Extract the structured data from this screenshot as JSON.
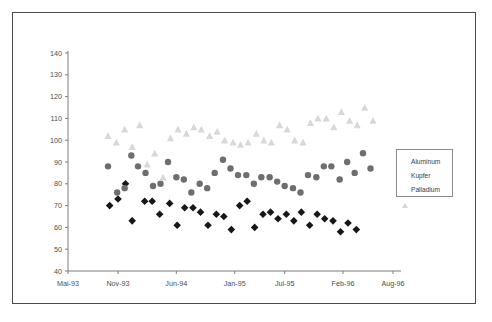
{
  "chart_data": {
    "type": "scatter",
    "title": "",
    "xlabel": "",
    "ylabel": "",
    "ylim": [
      40,
      140
    ],
    "ytick_step": 10,
    "yticks": [
      40,
      50,
      60,
      70,
      80,
      90,
      100,
      110,
      120,
      130,
      140
    ],
    "xticks": [
      "Mai-93",
      "Nov-93",
      "Jun-94",
      "Jan-95",
      "Jul-95",
      "Feb-96",
      "Aug-96"
    ],
    "xtick_positions_months": [
      0,
      6,
      13,
      20,
      26,
      33,
      39
    ],
    "grid": false,
    "legend_position": "right",
    "colors": {
      "aluminum": "#171717",
      "kupfer": "#6e6e6e",
      "palladium": "#d8d8d8",
      "axis": "#7d7d7d",
      "border": "#4a4a4a",
      "text": "#4d4d4d"
    },
    "series": [
      {
        "name": "Aluminum",
        "marker": "diamond",
        "color": "#171717",
        "points": [
          {
            "x": 5.0,
            "y": 70
          },
          {
            "x": 6.0,
            "y": 73
          },
          {
            "x": 6.9,
            "y": 80
          },
          {
            "x": 7.7,
            "y": 63
          },
          {
            "x": 9.2,
            "y": 72
          },
          {
            "x": 10.1,
            "y": 72
          },
          {
            "x": 11.0,
            "y": 66
          },
          {
            "x": 12.2,
            "y": 71
          },
          {
            "x": 13.1,
            "y": 61
          },
          {
            "x": 14.0,
            "y": 69
          },
          {
            "x": 15.0,
            "y": 69
          },
          {
            "x": 15.9,
            "y": 67
          },
          {
            "x": 16.8,
            "y": 61
          },
          {
            "x": 17.8,
            "y": 66
          },
          {
            "x": 18.7,
            "y": 65
          },
          {
            "x": 19.6,
            "y": 59
          },
          {
            "x": 20.6,
            "y": 70
          },
          {
            "x": 21.5,
            "y": 72
          },
          {
            "x": 22.4,
            "y": 60
          },
          {
            "x": 23.4,
            "y": 66
          },
          {
            "x": 24.3,
            "y": 67
          },
          {
            "x": 25.2,
            "y": 64
          },
          {
            "x": 26.2,
            "y": 66
          },
          {
            "x": 27.1,
            "y": 63
          },
          {
            "x": 28.0,
            "y": 67
          },
          {
            "x": 29.0,
            "y": 61
          },
          {
            "x": 29.9,
            "y": 66
          },
          {
            "x": 30.8,
            "y": 64
          },
          {
            "x": 31.8,
            "y": 63
          },
          {
            "x": 32.7,
            "y": 58
          },
          {
            "x": 33.6,
            "y": 62
          },
          {
            "x": 34.6,
            "y": 59
          }
        ]
      },
      {
        "name": "Kupfer",
        "marker": "circle",
        "color": "#6e6e6e",
        "points": [
          {
            "x": 4.8,
            "y": 88
          },
          {
            "x": 5.9,
            "y": 76
          },
          {
            "x": 6.8,
            "y": 78
          },
          {
            "x": 7.6,
            "y": 93
          },
          {
            "x": 8.4,
            "y": 88
          },
          {
            "x": 9.3,
            "y": 85
          },
          {
            "x": 10.2,
            "y": 79
          },
          {
            "x": 11.1,
            "y": 80
          },
          {
            "x": 12.0,
            "y": 90
          },
          {
            "x": 13.0,
            "y": 83
          },
          {
            "x": 13.9,
            "y": 82
          },
          {
            "x": 14.8,
            "y": 76
          },
          {
            "x": 15.8,
            "y": 80
          },
          {
            "x": 16.7,
            "y": 78
          },
          {
            "x": 17.6,
            "y": 85
          },
          {
            "x": 18.6,
            "y": 91
          },
          {
            "x": 19.5,
            "y": 87
          },
          {
            "x": 20.4,
            "y": 84
          },
          {
            "x": 21.4,
            "y": 84
          },
          {
            "x": 22.3,
            "y": 80
          },
          {
            "x": 23.2,
            "y": 83
          },
          {
            "x": 24.2,
            "y": 83
          },
          {
            "x": 25.1,
            "y": 81
          },
          {
            "x": 26.0,
            "y": 79
          },
          {
            "x": 27.0,
            "y": 78
          },
          {
            "x": 27.9,
            "y": 76
          },
          {
            "x": 28.8,
            "y": 84
          },
          {
            "x": 29.8,
            "y": 83
          },
          {
            "x": 30.7,
            "y": 88
          },
          {
            "x": 31.6,
            "y": 88
          },
          {
            "x": 32.6,
            "y": 82
          },
          {
            "x": 33.5,
            "y": 90
          },
          {
            "x": 34.4,
            "y": 85
          },
          {
            "x": 35.4,
            "y": 94
          },
          {
            "x": 36.3,
            "y": 87
          }
        ]
      },
      {
        "name": "Palladium",
        "marker": "triangle",
        "color": "#d8d8d8",
        "points": [
          {
            "x": 4.8,
            "y": 102
          },
          {
            "x": 5.8,
            "y": 99
          },
          {
            "x": 6.8,
            "y": 105
          },
          {
            "x": 7.7,
            "y": 97
          },
          {
            "x": 8.6,
            "y": 107
          },
          {
            "x": 9.5,
            "y": 89
          },
          {
            "x": 10.4,
            "y": 94
          },
          {
            "x": 11.4,
            "y": 83
          },
          {
            "x": 12.3,
            "y": 101
          },
          {
            "x": 13.2,
            "y": 105
          },
          {
            "x": 14.2,
            "y": 103
          },
          {
            "x": 15.1,
            "y": 106
          },
          {
            "x": 16.0,
            "y": 105
          },
          {
            "x": 17.0,
            "y": 102
          },
          {
            "x": 17.9,
            "y": 104
          },
          {
            "x": 18.8,
            "y": 100
          },
          {
            "x": 19.8,
            "y": 99
          },
          {
            "x": 20.7,
            "y": 98
          },
          {
            "x": 21.6,
            "y": 99
          },
          {
            "x": 22.6,
            "y": 103
          },
          {
            "x": 23.5,
            "y": 100
          },
          {
            "x": 24.4,
            "y": 99
          },
          {
            "x": 25.4,
            "y": 107
          },
          {
            "x": 26.3,
            "y": 105
          },
          {
            "x": 27.2,
            "y": 100
          },
          {
            "x": 28.2,
            "y": 99
          },
          {
            "x": 29.1,
            "y": 108
          },
          {
            "x": 30.0,
            "y": 110
          },
          {
            "x": 31.0,
            "y": 110
          },
          {
            "x": 31.9,
            "y": 106
          },
          {
            "x": 32.8,
            "y": 113
          },
          {
            "x": 33.8,
            "y": 109
          },
          {
            "x": 34.7,
            "y": 107
          },
          {
            "x": 35.6,
            "y": 115
          },
          {
            "x": 36.6,
            "y": 109
          }
        ]
      }
    ]
  },
  "legend": {
    "items": [
      {
        "label": "Aluminum",
        "marker": "diamond"
      },
      {
        "label": "Kupfer",
        "marker": "square"
      },
      {
        "label": "Palladium",
        "marker": "triangle"
      }
    ]
  }
}
